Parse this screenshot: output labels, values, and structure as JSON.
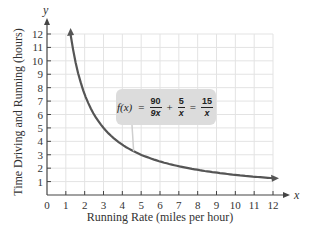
{
  "chart_data": {
    "type": "line",
    "title": "",
    "xlabel": "Running Rate (miles per hour)",
    "ylabel": "Time Driving and Running (hours)",
    "x_axis_var": "x",
    "y_axis_var": "y",
    "xlim": [
      0,
      12
    ],
    "ylim": [
      0,
      12
    ],
    "x_ticks": [
      "0",
      "1",
      "2",
      "3",
      "4",
      "5",
      "6",
      "7",
      "8",
      "9",
      "10",
      "11",
      "12"
    ],
    "y_ticks": [
      "1",
      "2",
      "3",
      "4",
      "5",
      "6",
      "7",
      "8",
      "9",
      "10",
      "11",
      "12"
    ],
    "grid": true,
    "series": [
      {
        "name": "f(x) = 15/x",
        "function": "15/x",
        "x": [
          1.25,
          1.5,
          2,
          2.5,
          3,
          4,
          5,
          6,
          7,
          8,
          9,
          10,
          11,
          12
        ],
        "values": [
          12,
          10,
          7.5,
          6,
          5,
          3.75,
          3,
          2.5,
          2.14,
          1.875,
          1.67,
          1.5,
          1.36,
          1.25
        ],
        "color": "#555555",
        "arrows_at_ends": true
      }
    ],
    "annotation": {
      "fn_name": "f(x)",
      "equals": "=",
      "term1_num": "90",
      "term1_den": "9x",
      "plus": "+",
      "term2_num": "5",
      "term2_den": "x",
      "equals2": "=",
      "result_num": "15",
      "result_den": "x",
      "box_color": "#dcdcdc"
    }
  }
}
